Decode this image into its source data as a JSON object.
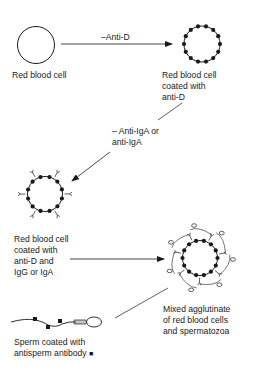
{
  "diagram": {
    "nodes": {
      "rbc": {
        "label": "Red blood cell"
      },
      "rbc_anti_d": {
        "label": "Red blood cell\ncoated with\nanti-D"
      },
      "rbc_anti_d_ig": {
        "label": "Red blood cell\ncoated with\nanti-D and\nIgG or IgA"
      },
      "agglutinate": {
        "label": "Mixed agglutinate\nof red blood cells\nand spermatozoa"
      },
      "sperm": {
        "label": "Sperm coated with\nantisperm antibody",
        "legend_marker": "■"
      }
    },
    "edges": [
      {
        "from": "rbc",
        "to": "rbc_anti_d",
        "label": "–Anti-D"
      },
      {
        "from": "rbc_anti_d",
        "to": "rbc_anti_d_ig",
        "label": "– Anti-IgA or\nanti-IgA"
      },
      {
        "from": "rbc_anti_d_ig",
        "to": "agglutinate",
        "label": ""
      },
      {
        "from": "sperm",
        "to": "agglutinate",
        "label": ""
      }
    ],
    "colors": {
      "stroke": "#1a1a1a",
      "background": "#ffffff"
    }
  }
}
